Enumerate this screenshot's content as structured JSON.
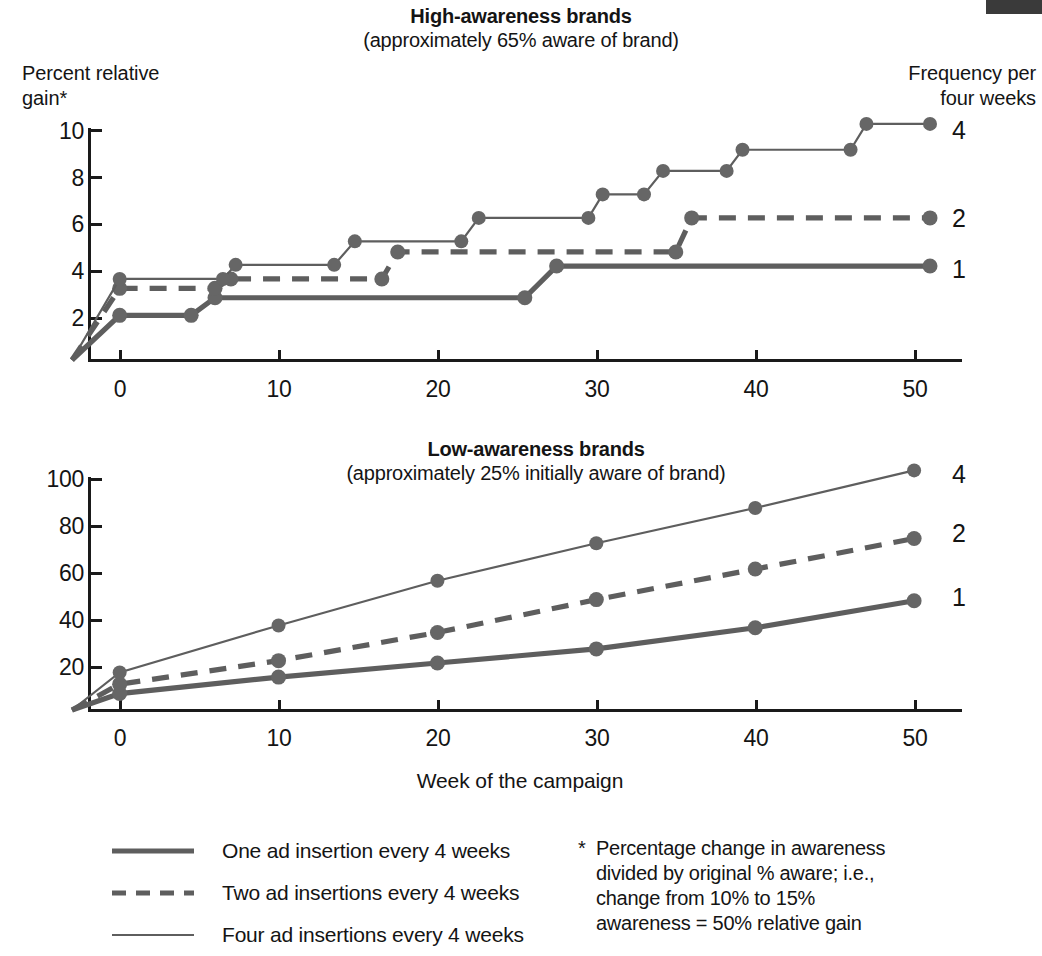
{
  "page": {
    "background": "#ffffff",
    "ink": "#141414",
    "line_color": "#5e5e5e",
    "marker_color": "#666666"
  },
  "top_chart": {
    "title": "High-awareness brands",
    "subtitle": "(approximately 65% aware of brand)",
    "y_axis_label_line1": "Percent relative",
    "y_axis_label_line2": "gain*",
    "legend_header_line1": "Frequency per",
    "legend_header_line2": "four weeks",
    "y_ticks": [
      "10",
      "8",
      "6",
      "4",
      "2"
    ],
    "x_ticks": [
      "0",
      "10",
      "20",
      "30",
      "40",
      "50"
    ],
    "series_end_labels": [
      "4",
      "2",
      "1"
    ]
  },
  "bottom_chart": {
    "title": "Low-awareness brands",
    "subtitle": "(approximately 25% initially aware of brand)",
    "y_ticks": [
      "100",
      "80",
      "60",
      "40",
      "20"
    ],
    "x_ticks": [
      "0",
      "10",
      "20",
      "30",
      "40",
      "50"
    ],
    "x_axis_label": "Week of the campaign",
    "series_end_labels": [
      "4",
      "2",
      "1"
    ]
  },
  "legend": {
    "items": [
      {
        "swatch": "thick-solid-line",
        "label": "One ad insertion every 4 weeks"
      },
      {
        "swatch": "dashed-line",
        "label": "Two ad insertions every 4 weeks"
      },
      {
        "swatch": "thin-solid-line",
        "label": "Four ad insertions every 4 weeks"
      }
    ]
  },
  "footnote": {
    "marker": "*",
    "line1": "Percentage change in awareness",
    "line2": "divided by original % aware; i.e.,",
    "line3": "change from 10% to 15%",
    "line4": "awareness = 50% relative gain"
  },
  "chart_data": [
    {
      "id": "high-awareness",
      "type": "line",
      "style": "step",
      "title": "High-awareness brands",
      "subtitle": "(approximately 65% aware of brand)",
      "xlabel": "Week of the campaign",
      "ylabel": "Percent relative gain*",
      "xlim": [
        -3,
        51
      ],
      "ylim": [
        0,
        10.6
      ],
      "xticks": [
        0,
        10,
        20,
        30,
        40,
        50
      ],
      "yticks": [
        2,
        4,
        6,
        8,
        10
      ],
      "grid": false,
      "legend_position": "right-of-axes",
      "series": [
        {
          "name": "1",
          "legend": "One ad insertion every 4 weeks",
          "linestyle": "thick-solid",
          "x": [
            -3,
            0,
            4.5,
            6,
            25.5,
            27.5,
            51
          ],
          "y": [
            0,
            1.9,
            1.9,
            2.65,
            2.65,
            4.0,
            4.0
          ],
          "markers_x": [
            0,
            4.5,
            6,
            25.5,
            27.5,
            51
          ],
          "markers_y": [
            1.9,
            1.9,
            2.65,
            2.65,
            4.0,
            4.0
          ]
        },
        {
          "name": "2",
          "legend": "Two ad insertions every 4 weeks",
          "linestyle": "dashed",
          "x": [
            -3,
            0,
            6,
            7,
            16.5,
            17.5,
            35,
            36,
            51
          ],
          "y": [
            0,
            3.05,
            3.05,
            3.45,
            3.45,
            4.6,
            4.6,
            6.05,
            6.05
          ],
          "markers_x": [
            0,
            6,
            7,
            16.5,
            17.5,
            35,
            36,
            51
          ],
          "markers_y": [
            3.05,
            3.05,
            3.45,
            3.45,
            4.6,
            4.6,
            6.05,
            6.05
          ]
        },
        {
          "name": "4",
          "legend": "Four ad insertions every 4 weeks",
          "linestyle": "thin-solid",
          "x": [
            -3,
            0,
            6.5,
            7.3,
            13.5,
            14.8,
            21.5,
            22.6,
            29.5,
            30.4,
            33,
            34.2,
            38.2,
            39.2,
            46,
            47,
            51
          ],
          "y": [
            0,
            3.45,
            3.45,
            4.05,
            4.05,
            5.05,
            5.05,
            6.05,
            6.05,
            7.05,
            7.05,
            8.05,
            8.05,
            8.95,
            8.95,
            10.05,
            10.05
          ],
          "markers_x": [
            0,
            6.5,
            7.3,
            13.5,
            14.8,
            21.5,
            22.6,
            29.5,
            30.4,
            33,
            34.2,
            38.2,
            39.2,
            46,
            47,
            51
          ],
          "markers_y": [
            3.45,
            3.45,
            4.05,
            4.05,
            5.05,
            5.05,
            6.05,
            6.05,
            7.05,
            7.05,
            8.05,
            8.05,
            8.95,
            8.95,
            10.05,
            10.05
          ]
        }
      ]
    },
    {
      "id": "low-awareness",
      "type": "line",
      "style": "smooth",
      "title": "Low-awareness brands",
      "subtitle": "(approximately 25% initially aware of brand)",
      "xlabel": "Week of the campaign",
      "ylabel": "Percent relative gain*",
      "xlim": [
        -3,
        51
      ],
      "ylim": [
        0,
        106
      ],
      "xticks": [
        0,
        10,
        20,
        30,
        40,
        50
      ],
      "yticks": [
        20,
        40,
        60,
        80,
        100
      ],
      "grid": false,
      "legend_position": "right-of-axes",
      "x": [
        0,
        10,
        20,
        30,
        40,
        50
      ],
      "series": [
        {
          "name": "1",
          "legend": "One ad insertion every 4 weeks",
          "linestyle": "thick-solid",
          "values": [
            7,
            14,
            20,
            26,
            35,
            46.5
          ]
        },
        {
          "name": "2",
          "legend": "Two ad insertions every 4 weeks",
          "linestyle": "dashed",
          "values": [
            11,
            21,
            33,
            47,
            60,
            73
          ]
        },
        {
          "name": "4",
          "legend": "Four ad insertions every 4 weeks",
          "linestyle": "thin-solid",
          "values": [
            16,
            36,
            55,
            71,
            86,
            102
          ]
        }
      ]
    }
  ]
}
